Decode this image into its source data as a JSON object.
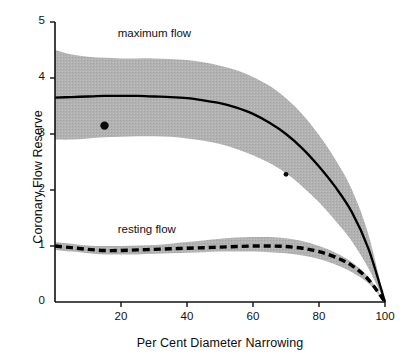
{
  "chart_data": {
    "type": "line",
    "title": "",
    "xlabel": "Per Cent Diameter Narrowing",
    "ylabel": "Coronary Flow Reserve",
    "xlim": [
      0,
      100
    ],
    "ylim": [
      0,
      5
    ],
    "grid": false,
    "legend_position": "inline-annotation",
    "xticks": [
      0,
      20,
      40,
      60,
      80,
      100
    ],
    "xtick_labels": [
      "",
      "20",
      "40",
      "60",
      "80",
      "100"
    ],
    "yticks": [
      0,
      1,
      2,
      3,
      4,
      5
    ],
    "ytick_labels": [
      "0",
      "1",
      "2",
      "3",
      "4",
      "5"
    ],
    "band_color": "#a8a8a8",
    "line_color": "#000000",
    "series": [
      {
        "name": "maximum flow",
        "style": "solid",
        "x": [
          0,
          5,
          10,
          15,
          20,
          25,
          30,
          35,
          40,
          45,
          50,
          55,
          60,
          65,
          70,
          75,
          80,
          85,
          90,
          95,
          100
        ],
        "values": [
          3.65,
          3.66,
          3.67,
          3.68,
          3.68,
          3.68,
          3.67,
          3.66,
          3.64,
          3.6,
          3.55,
          3.47,
          3.36,
          3.2,
          3.0,
          2.74,
          2.42,
          2.05,
          1.6,
          0.95,
          0.0
        ],
        "band_upper": [
          4.5,
          4.42,
          4.38,
          4.36,
          4.35,
          4.35,
          4.35,
          4.34,
          4.32,
          4.28,
          4.22,
          4.14,
          4.02,
          3.86,
          3.64,
          3.35,
          2.98,
          2.54,
          2.0,
          1.2,
          0.0
        ],
        "band_lower": [
          2.9,
          2.9,
          2.92,
          2.94,
          2.95,
          2.96,
          2.96,
          2.95,
          2.92,
          2.88,
          2.82,
          2.73,
          2.62,
          2.48,
          2.3,
          2.06,
          1.78,
          1.45,
          1.08,
          0.6,
          0.0
        ]
      },
      {
        "name": "resting flow",
        "style": "dashed",
        "x": [
          0,
          5,
          10,
          15,
          20,
          25,
          30,
          35,
          40,
          45,
          50,
          55,
          60,
          65,
          70,
          75,
          80,
          85,
          90,
          95,
          100
        ],
        "values": [
          1.0,
          0.97,
          0.94,
          0.92,
          0.92,
          0.93,
          0.94,
          0.95,
          0.96,
          0.97,
          0.98,
          0.99,
          1.0,
          1.0,
          0.99,
          0.96,
          0.9,
          0.8,
          0.65,
          0.4,
          0.0
        ],
        "band_upper": [
          1.07,
          1.04,
          1.01,
          1.0,
          1.0,
          1.01,
          1.02,
          1.04,
          1.07,
          1.1,
          1.13,
          1.15,
          1.16,
          1.16,
          1.14,
          1.09,
          1.0,
          0.88,
          0.71,
          0.44,
          0.0
        ],
        "band_lower": [
          0.93,
          0.9,
          0.87,
          0.85,
          0.85,
          0.85,
          0.86,
          0.87,
          0.88,
          0.89,
          0.9,
          0.9,
          0.9,
          0.89,
          0.87,
          0.83,
          0.77,
          0.67,
          0.53,
          0.33,
          0.0
        ]
      }
    ],
    "data_points": [
      {
        "x": 15,
        "y": 3.15
      },
      {
        "x": 70,
        "y": 2.28
      }
    ],
    "annotations": [
      {
        "text": "maximum flow",
        "x": 19,
        "y": 4.78
      },
      {
        "text": "resting flow",
        "x": 19,
        "y": 1.28
      }
    ]
  }
}
